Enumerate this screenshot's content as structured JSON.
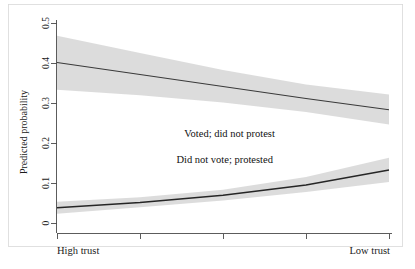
{
  "chart_data": {
    "type": "line",
    "title": "",
    "subtitle": "",
    "xlabel": "",
    "ylabel": "Predicted probability",
    "xlim": [
      0,
      4
    ],
    "ylim": [
      0,
      0.5
    ],
    "grid": false,
    "legend_position": "inline-annotation",
    "y_ticks": [
      "0",
      "0.1",
      "0.2",
      "0.3",
      "0.4",
      "0.5"
    ],
    "y_tick_values": [
      0,
      0.1,
      0.2,
      0.3,
      0.4,
      0.5
    ],
    "x_tick_values": [
      0,
      1,
      2,
      3,
      4
    ],
    "x_tick_labels": [
      "",
      "",
      "",
      "",
      ""
    ],
    "x_end_labels": {
      "left": "High trust",
      "right": "Low trust"
    },
    "x": [
      0,
      1,
      2,
      3,
      4
    ],
    "series": [
      {
        "name": "Voted; did not protest",
        "values": [
          0.4,
          0.37,
          0.34,
          0.31,
          0.282
        ],
        "ci_lower": [
          0.332,
          0.318,
          0.3,
          0.276,
          0.245
        ],
        "ci_upper": [
          0.467,
          0.424,
          0.381,
          0.345,
          0.32
        ],
        "label_x": 2.08,
        "label_y": 0.213,
        "band_color": "#d6d6d6",
        "line_color": "#3a3a3a"
      },
      {
        "name": "Did not vote; protested",
        "values": [
          0.037,
          0.05,
          0.068,
          0.094,
          0.131
        ],
        "ci_lower": [
          0.022,
          0.038,
          0.055,
          0.076,
          0.101
        ],
        "ci_upper": [
          0.052,
          0.063,
          0.082,
          0.114,
          0.162
        ],
        "label_x": 2.02,
        "label_y": 0.148,
        "band_color": "#d6d6d6",
        "line_color": "#262626"
      }
    ],
    "annotations": [
      {
        "text": "Voted; did not protest",
        "x": 2.08,
        "y": 0.213
      },
      {
        "text": "Did not vote; protested",
        "x": 2.02,
        "y": 0.148
      }
    ],
    "colors": {
      "band": "#d6d6d6",
      "line_upper": "#3a3a3a",
      "line_lower": "#262626",
      "axis": "#4a4a4a",
      "frame": "#d8d8d8",
      "background": "#ffffff",
      "text": "#1a1a1a"
    }
  }
}
